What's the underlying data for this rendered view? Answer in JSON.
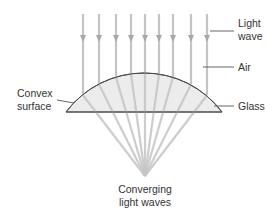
{
  "diagram": {
    "labels": {
      "light_wave": [
        "Light",
        "wave"
      ],
      "air": "Air",
      "glass": "Glass",
      "convex_surface": [
        "Convex",
        "surface"
      ],
      "converging": [
        "Converging",
        "light waves"
      ]
    },
    "colors": {
      "ray": "#c4c4c4",
      "arrow": "#a8a8a8",
      "lens_fill": "#ececec",
      "lens_stroke": "#4a4a4a",
      "leader": "#555555",
      "text": "#333333"
    },
    "rays": {
      "x_positions": [
        83,
        99,
        116,
        131,
        145,
        159,
        173,
        191,
        207
      ],
      "top_y": 14,
      "arrow_y": 40,
      "focus": [
        145,
        176
      ]
    },
    "lens": {
      "left": [
        66,
        112
      ],
      "right": [
        222,
        112
      ],
      "apex": [
        145,
        73
      ]
    }
  }
}
